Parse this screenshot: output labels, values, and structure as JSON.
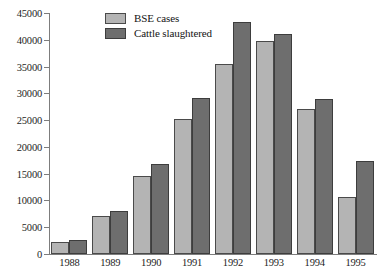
{
  "chart_data": {
    "type": "bar",
    "title": "",
    "subtitle": "",
    "xlabel": "",
    "ylabel": "",
    "categories": [
      "1988",
      "1989",
      "1990",
      "1991",
      "1992",
      "1993",
      "1994",
      "1995"
    ],
    "series": [
      {
        "name": "BSE cases",
        "color": "#b4b4b4",
        "values": [
          2300,
          7100,
          14500,
          25200,
          35400,
          39800,
          27100,
          10700
        ]
      },
      {
        "name": "Cattle slaughtered",
        "color": "#6e6e6e",
        "values": [
          2700,
          8000,
          16800,
          29200,
          43300,
          41000,
          28900,
          17300
        ]
      }
    ],
    "ylim": [
      0,
      45000
    ],
    "ytick_values": [
      0,
      5000,
      10000,
      15000,
      20000,
      25000,
      30000,
      35000,
      40000,
      45000
    ],
    "ytick_labels": [
      "0",
      "5000",
      "10000",
      "15000",
      "20000",
      "25000",
      "30000",
      "35000",
      "40000",
      "45000"
    ],
    "grid": false,
    "legend_position": "top-left",
    "axis_color": "#7d7d7d",
    "background": "#ffffff"
  }
}
